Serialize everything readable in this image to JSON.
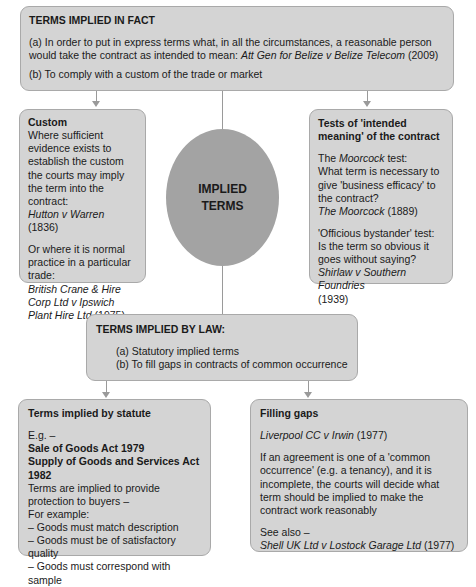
{
  "terms_in_fact": {
    "title": "TERMS IMPLIED IN FACT",
    "a_text": "(a) In order to put in express terms what, in all the circumstances, a reasonable person would take the contract as intended to mean: ",
    "a_case": "Att Gen for Belize v Belize Telecom",
    "a_year": " (2009)",
    "b_text": "(b) To comply with a custom of the trade or market"
  },
  "custom": {
    "title": "Custom",
    "text1": "Where sufficient evidence exists to establish the custom the courts may imply the term into the contract:",
    "case1": "Hutton v Warren",
    "year1": " (1836)",
    "text2": "Or where it is normal practice in a particular trade:",
    "case2": "British Crane & Hire Corp Ltd v Ipswich Plant Hire Ltd",
    "year2": " (1975)"
  },
  "center": {
    "line1": "IMPLIED",
    "line2": "TERMS"
  },
  "tests": {
    "title": "Tests of 'intended meaning' of the contract",
    "moorcock_pre": "The ",
    "moorcock_name": "Moorcock",
    "moorcock_post": " test:",
    "moorcock_q": "What term is necessary to give 'business efficacy' to the contract?",
    "moorcock_case": "The Moorcock",
    "moorcock_year": " (1889)",
    "bystander_label": "'Officious bystander' test:",
    "bystander_q": "Is the term so obvious it goes without saying?",
    "bystander_case": "Shirlaw v Southern Foundries",
    "bystander_year": "(1939)"
  },
  "terms_by_law": {
    "title": "TERMS IMPLIED BY LAW:",
    "items": [
      "(a)  Statutory implied terms",
      "(b)  To fill gaps in contracts of common occurrence"
    ]
  },
  "statute": {
    "title": "Terms implied by statute",
    "eg": "E.g. –",
    "act1": "Sale of Goods Act 1979",
    "act2": "Supply of Goods and Services Act 1982",
    "text": "Terms are implied to provide protection to buyers –",
    "for_example": "For example:",
    "items": [
      "– Goods must match description",
      "– Goods must be of satisfactory quality",
      "– Goods must correspond with sample"
    ]
  },
  "filling": {
    "title": "Filling gaps",
    "case": "Liverpool CC v Irwin",
    "year": " (1977)",
    "text": "If an agreement is one of a 'common occurrence' (e.g. a tenancy), and it is incomplete, the courts will decide what term should be implied to make the contract work reasonably",
    "see_also": "See also –",
    "case2": "Shell UK Ltd v Lostock Garage Ltd",
    "year2": " (1977)"
  }
}
